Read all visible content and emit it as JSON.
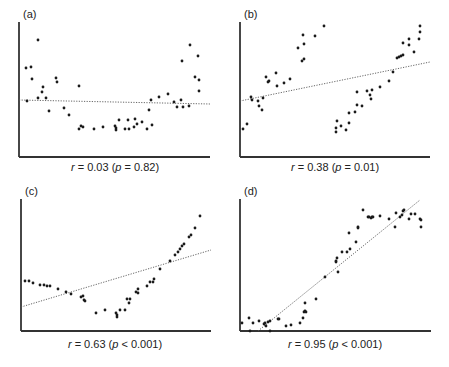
{
  "figure": {
    "colors": {
      "axis": "#333333",
      "points": "#1a1a1a",
      "fit_line": "#555555",
      "background": "#ffffff"
    }
  },
  "chart_data": [
    {
      "type": "scatter",
      "panel": "(a)",
      "title": "",
      "caption": {
        "r_symbol": "r",
        "r_text": " = 0.03 (",
        "p_symbol": "p",
        "p_text": " = 0.82)"
      },
      "r": 0.03,
      "p": 0.82,
      "p_relation": "=",
      "xlabel": "",
      "ylabel": "",
      "grid": false,
      "legend": null,
      "axes_px": {
        "x0": 19,
        "x1": 210,
        "y_top": 22,
        "y_bottom": 157
      },
      "fit_line_px": [
        [
          19,
          100
        ],
        [
          210,
          104
        ]
      ],
      "points_px": [
        [
          26,
          68
        ],
        [
          27,
          101
        ],
        [
          31,
          67
        ],
        [
          32,
          79
        ],
        [
          38,
          40
        ],
        [
          38,
          98
        ],
        [
          42,
          92
        ],
        [
          43,
          87
        ],
        [
          46,
          98
        ],
        [
          49,
          111
        ],
        [
          56,
          78
        ],
        [
          57,
          82
        ],
        [
          64,
          108
        ],
        [
          69,
          115
        ],
        [
          79,
          86
        ],
        [
          79,
          129
        ],
        [
          81,
          126
        ],
        [
          83,
          127
        ],
        [
          94,
          129
        ],
        [
          103,
          127
        ],
        [
          115,
          126
        ],
        [
          116,
          128
        ],
        [
          116,
          130
        ],
        [
          119,
          120
        ],
        [
          125,
          129
        ],
        [
          128,
          120
        ],
        [
          129,
          129
        ],
        [
          134,
          127
        ],
        [
          135,
          119
        ],
        [
          137,
          124
        ],
        [
          142,
          122
        ],
        [
          147,
          129
        ],
        [
          149,
          110
        ],
        [
          151,
          100
        ],
        [
          152,
          125
        ],
        [
          159,
          97
        ],
        [
          168,
          94
        ],
        [
          174,
          102
        ],
        [
          177,
          107
        ],
        [
          181,
          100
        ],
        [
          183,
          107
        ],
        [
          182,
          61
        ],
        [
          189,
          106
        ],
        [
          190,
          45
        ],
        [
          195,
          77
        ],
        [
          198,
          56
        ],
        [
          199,
          80
        ],
        [
          199,
          91
        ]
      ]
    },
    {
      "type": "scatter",
      "panel": "(b)",
      "title": "",
      "caption": {
        "r_symbol": "r",
        "r_text": " = 0.38 (",
        "p_symbol": "p",
        "p_text": " = 0.01)"
      },
      "r": 0.38,
      "p": 0.01,
      "p_relation": "=",
      "xlabel": "",
      "ylabel": "",
      "grid": false,
      "legend": null,
      "axes_px": {
        "x0": 240,
        "x1": 430,
        "y_top": 22,
        "y_bottom": 157
      },
      "fit_line_px": [
        [
          240,
          101
        ],
        [
          430,
          62
        ]
      ],
      "points_px": [
        [
          243,
          129
        ],
        [
          247,
          124
        ],
        [
          251,
          97
        ],
        [
          252,
          100
        ],
        [
          258,
          101
        ],
        [
          259,
          106
        ],
        [
          262,
          110
        ],
        [
          263,
          98
        ],
        [
          266,
          77
        ],
        [
          268,
          82
        ],
        [
          269,
          81
        ],
        [
          276,
          73
        ],
        [
          277,
          86
        ],
        [
          284,
          83
        ],
        [
          290,
          79
        ],
        [
          298,
          48
        ],
        [
          302,
          61
        ],
        [
          303,
          35
        ],
        [
          304,
          59
        ],
        [
          304,
          44
        ],
        [
          315,
          36
        ],
        [
          324,
          26
        ],
        [
          337,
          121
        ],
        [
          336,
          128
        ],
        [
          336,
          132
        ],
        [
          341,
          126
        ],
        [
          346,
          130
        ],
        [
          349,
          123
        ],
        [
          349,
          113
        ],
        [
          355,
          112
        ],
        [
          357,
          105
        ],
        [
          357,
          92
        ],
        [
          362,
          106
        ],
        [
          367,
          91
        ],
        [
          370,
          95
        ],
        [
          371,
          99
        ],
        [
          372,
          90
        ],
        [
          380,
          87
        ],
        [
          389,
          81
        ],
        [
          393,
          72
        ],
        [
          397,
          58
        ],
        [
          399,
          57
        ],
        [
          401,
          56
        ],
        [
          403,
          55
        ],
        [
          403,
          43
        ],
        [
          409,
          45
        ],
        [
          409,
          39
        ],
        [
          414,
          52
        ],
        [
          419,
          39
        ],
        [
          420,
          32
        ],
        [
          420,
          26
        ]
      ]
    },
    {
      "type": "scatter",
      "panel": "(c)",
      "title": "",
      "caption": {
        "r_symbol": "r",
        "r_text": " = 0.63 (",
        "p_symbol": "p",
        "p_text": " < 0.001)"
      },
      "r": 0.63,
      "p": 0.001,
      "p_relation": "<",
      "xlabel": "",
      "ylabel": "",
      "grid": false,
      "legend": null,
      "axes_px": {
        "x0": 21,
        "x1": 211,
        "y_top": 199,
        "y_bottom": 331
      },
      "fit_line_px": [
        [
          21,
          307
        ],
        [
          211,
          250
        ]
      ],
      "points_px": [
        [
          25,
          281
        ],
        [
          29,
          281
        ],
        [
          33,
          283
        ],
        [
          40,
          285
        ],
        [
          44,
          285
        ],
        [
          47,
          286
        ],
        [
          50,
          286
        ],
        [
          58,
          289
        ],
        [
          66,
          292
        ],
        [
          71,
          294
        ],
        [
          81,
          297
        ],
        [
          83,
          296
        ],
        [
          84,
          300
        ],
        [
          85,
          301
        ],
        [
          96,
          313
        ],
        [
          105,
          310
        ],
        [
          116,
          313
        ],
        [
          117,
          315
        ],
        [
          117,
          317
        ],
        [
          120,
          310
        ],
        [
          125,
          310
        ],
        [
          127,
          299
        ],
        [
          130,
          299
        ],
        [
          129,
          303
        ],
        [
          136,
          292
        ],
        [
          138,
          289
        ],
        [
          138,
          293
        ],
        [
          147,
          286
        ],
        [
          150,
          282
        ],
        [
          153,
          282
        ],
        [
          154,
          279
        ],
        [
          160,
          269
        ],
        [
          170,
          261
        ],
        [
          175,
          255
        ],
        [
          178,
          252
        ],
        [
          180,
          249
        ],
        [
          182,
          246
        ],
        [
          184,
          244
        ],
        [
          189,
          237
        ],
        [
          191,
          235
        ],
        [
          195,
          228
        ],
        [
          200,
          216
        ]
      ]
    },
    {
      "type": "scatter",
      "panel": "(d)",
      "title": "",
      "caption": {
        "r_symbol": "r",
        "r_text": " = 0.95 (",
        "p_symbol": "p",
        "p_text": " < 0.001)"
      },
      "r": 0.95,
      "p": 0.001,
      "p_relation": "<",
      "xlabel": "",
      "ylabel": "",
      "grid": false,
      "legend": null,
      "axes_px": {
        "x0": 240,
        "x1": 431,
        "y_top": 199,
        "y_bottom": 331
      },
      "fit_line_px": [
        [
          258,
          331
        ],
        [
          420,
          200
        ]
      ],
      "points_px": [
        [
          242,
          323
        ],
        [
          249,
          318
        ],
        [
          253,
          323
        ],
        [
          250,
          331
        ],
        [
          259,
          321
        ],
        [
          264,
          324
        ],
        [
          265,
          323
        ],
        [
          266,
          326
        ],
        [
          268,
          322
        ],
        [
          270,
          321
        ],
        [
          270,
          331
        ],
        [
          278,
          319
        ],
        [
          279,
          319
        ],
        [
          286,
          326
        ],
        [
          291,
          325
        ],
        [
          300,
          323
        ],
        [
          303,
          318
        ],
        [
          304,
          312
        ],
        [
          305,
          311
        ],
        [
          305,
          303
        ],
        [
          306,
          312
        ],
        [
          316,
          299
        ],
        [
          325,
          277
        ],
        [
          336,
          262
        ],
        [
          336,
          261
        ],
        [
          337,
          258
        ],
        [
          338,
          272
        ],
        [
          342,
          252
        ],
        [
          347,
          252
        ],
        [
          350,
          249
        ],
        [
          349,
          233
        ],
        [
          356,
          242
        ],
        [
          358,
          228
        ],
        [
          358,
          227
        ],
        [
          363,
          210
        ],
        [
          368,
          217
        ],
        [
          369,
          217
        ],
        [
          371,
          218
        ],
        [
          372,
          217
        ],
        [
          373,
          217
        ],
        [
          380,
          216
        ],
        [
          389,
          219
        ],
        [
          395,
          227
        ],
        [
          396,
          213
        ],
        [
          400,
          217
        ],
        [
          402,
          215
        ],
        [
          403,
          211
        ],
        [
          404,
          210
        ],
        [
          409,
          219
        ],
        [
          411,
          214
        ],
        [
          415,
          214
        ],
        [
          420,
          219
        ],
        [
          421,
          220
        ],
        [
          421,
          227
        ]
      ]
    }
  ],
  "captions_pos": [
    {
      "x": 115,
      "y": 171
    },
    {
      "x": 335,
      "y": 171
    },
    {
      "x": 115,
      "y": 348
    },
    {
      "x": 335,
      "y": 348
    }
  ],
  "label_pos": [
    {
      "x": 23,
      "y": 20
    },
    {
      "x": 244,
      "y": 20
    },
    {
      "x": 25,
      "y": 197
    },
    {
      "x": 244,
      "y": 197
    }
  ]
}
